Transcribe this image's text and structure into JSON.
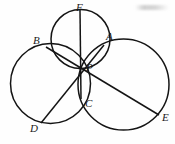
{
  "figure": {
    "kind": "geometry-diagram",
    "width": 175,
    "height": 144,
    "background_color": "#fefefe",
    "stroke_color": "#141414",
    "label_color": "#1a1a1a"
  },
  "points": [
    {
      "id": "F",
      "label": "F",
      "x": 80,
      "y": 10,
      "label_x": 76,
      "label_y": 2
    },
    {
      "id": "A",
      "label": "A",
      "x": 104,
      "y": 45,
      "label_x": 106,
      "label_y": 31
    },
    {
      "id": "B",
      "label": "B",
      "x": 46,
      "y": 47,
      "label_x": 33,
      "label_y": 35
    },
    {
      "id": "P",
      "label": "P",
      "x": 80,
      "y": 68,
      "label_x": 86,
      "label_y": 62
    },
    {
      "id": "C",
      "label": "C",
      "x": 81,
      "y": 99,
      "label_x": 85,
      "label_y": 98
    },
    {
      "id": "D",
      "label": "D",
      "x": 41,
      "y": 123,
      "label_x": 30,
      "label_y": 123
    },
    {
      "id": "E",
      "label": "E",
      "x": 159,
      "y": 115,
      "label_x": 162,
      "label_y": 112
    }
  ],
  "circles": [
    {
      "id": "top-circle",
      "name": "circle-FBPA",
      "cx": 80.5,
      "cy": 39.0,
      "r": 29.5
    },
    {
      "id": "left-circle",
      "name": "circle-BDCP",
      "cx": 50.5,
      "cy": 83.5,
      "r": 40.0
    },
    {
      "id": "right-circle",
      "name": "circle-ACEP",
      "cx": 123.5,
      "cy": 84.5,
      "r": 45.5
    }
  ],
  "chords": [
    {
      "id": "chord-FC",
      "from": "F",
      "to": "C"
    },
    {
      "id": "chord-AD",
      "from": "A",
      "to": "D"
    },
    {
      "id": "chord-BE",
      "from": "B",
      "to": "E"
    }
  ],
  "labels": {
    "A": "A",
    "B": "B",
    "C": "C",
    "D": "D",
    "E": "E",
    "F": "F",
    "P": "P"
  },
  "artifacts": {
    "smudge_note": "faint scan smudge, top-right corner"
  }
}
